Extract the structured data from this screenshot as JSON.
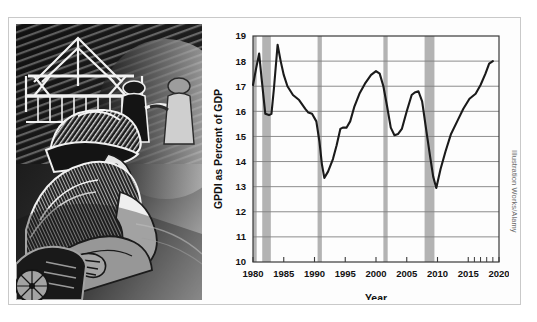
{
  "figure": {
    "credit": "Illustration Works/Alamy"
  },
  "illustration": {
    "name": "construction-worker-woodcut",
    "description": "Woodcut-style illustration of a hard-hatted construction worker operating equipment in front of a building frame"
  },
  "chart_data": {
    "type": "line",
    "title": "",
    "xlabel": "Year",
    "ylabel": "GPDI as Percent of GDP",
    "xlim": [
      1980,
      2020
    ],
    "ylim": [
      10,
      19
    ],
    "xticks": [
      1980,
      1985,
      1990,
      1995,
      2000,
      2005,
      2010,
      2015,
      2020
    ],
    "xtick_labels": [
      "1980",
      "1985",
      "1990",
      "1995",
      "2000",
      "2005",
      "2010",
      "2015",
      "2020"
    ],
    "yticks": [
      10,
      11,
      12,
      13,
      14,
      15,
      16,
      17,
      18,
      19
    ],
    "ytick_labels": [
      "10",
      "11",
      "12",
      "13",
      "14",
      "15",
      "16",
      "17",
      "18",
      "19"
    ],
    "grid": "horizontal",
    "legend": "none",
    "line_color": "#1a1a1a",
    "recession_band_color": "#b3b3b3",
    "recession_bands": [
      {
        "start": 1980.0,
        "end": 1980.6
      },
      {
        "start": 1981.5,
        "end": 1982.9
      },
      {
        "start": 1990.5,
        "end": 1991.2
      },
      {
        "start": 2001.2,
        "end": 2001.9
      },
      {
        "start": 2007.9,
        "end": 2009.5
      }
    ],
    "x": [
      1980.0,
      1980.5,
      1981.0,
      1981.4,
      1982.0,
      1982.6,
      1983.0,
      1983.4,
      1984.0,
      1984.5,
      1985.0,
      1985.6,
      1986.5,
      1987.5,
      1988.5,
      1989.0,
      1989.6,
      1990.3,
      1990.8,
      1991.2,
      1991.6,
      1992.2,
      1993.0,
      1993.6,
      1994.2,
      1994.6,
      1995.2,
      1995.8,
      1996.5,
      1997.3,
      1998.2,
      1999.2,
      2000.0,
      2000.6,
      2001.2,
      2001.8,
      2002.4,
      2003.0,
      2003.6,
      2004.2,
      2005.0,
      2005.8,
      2006.3,
      2006.9,
      2007.5,
      2008.2,
      2008.8,
      2009.3,
      2009.8,
      2010.5,
      2011.3,
      2012.2,
      2013.2,
      2014.2,
      2015.2,
      2016.2,
      2017.0,
      2017.8,
      2018.4,
      2019.0
    ],
    "values": [
      17.05,
      17.7,
      18.3,
      17.3,
      15.9,
      15.85,
      15.9,
      16.9,
      18.65,
      18.0,
      17.45,
      17.0,
      16.65,
      16.45,
      16.1,
      15.95,
      15.9,
      15.6,
      14.8,
      13.9,
      13.35,
      13.6,
      14.1,
      14.65,
      15.3,
      15.35,
      15.35,
      15.6,
      16.2,
      16.7,
      17.1,
      17.45,
      17.6,
      17.5,
      17.0,
      16.2,
      15.35,
      15.05,
      15.1,
      15.3,
      16.0,
      16.65,
      16.75,
      16.8,
      16.4,
      15.2,
      14.2,
      13.4,
      12.95,
      13.7,
      14.4,
      15.1,
      15.6,
      16.1,
      16.5,
      16.7,
      17.05,
      17.5,
      17.9,
      18.0
    ]
  }
}
